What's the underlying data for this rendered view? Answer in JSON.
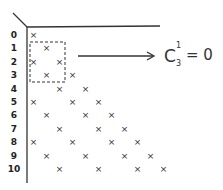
{
  "diagram": {
    "row_labels": [
      "0",
      "1",
      "2",
      "3",
      "4",
      "5",
      "6",
      "7",
      "8",
      "9",
      "10"
    ],
    "mark_symbol": "×",
    "marks_by_row": [
      [
        0
      ],
      [
        1
      ],
      [
        0,
        2
      ],
      [
        1,
        3
      ],
      [
        2,
        4
      ],
      [
        0,
        3,
        5
      ],
      [
        1,
        4,
        6
      ],
      [
        2,
        5,
        7
      ],
      [
        0,
        3,
        6,
        8
      ],
      [
        1,
        4,
        7,
        9
      ],
      [
        2,
        5,
        8,
        10
      ]
    ],
    "highlight_box": {
      "rows": [
        1,
        3
      ],
      "cols": [
        0,
        2
      ],
      "style": "dashed"
    },
    "formula": {
      "base": "C",
      "superscript": "1",
      "subscript": "3",
      "rest": "= 0"
    },
    "colors": {
      "ink": "#333333",
      "background": "#ffffff"
    }
  }
}
